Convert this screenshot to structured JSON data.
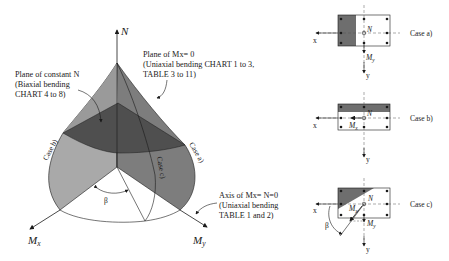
{
  "figure": {
    "surface": {
      "axes": {
        "vertical": "N",
        "left": "Mx",
        "left_sub": "x",
        "right": "My",
        "right_sub": "y"
      },
      "angle_label": "β",
      "curve_labels": [
        "Case b)",
        "Case c)",
        "Case a)"
      ],
      "annotations": {
        "constant_n": [
          "Plane of constant N",
          "(Biaxial bending",
          "CHART 4 to 8)"
        ],
        "mx_zero": [
          "Plane of Mx= 0",
          "(Uniaxial bending CHART 1 to 3,",
          "TABLE 3 to 11)"
        ],
        "axis_mx_n_zero": [
          "Axis of Mx= N=0",
          "(Uniaxial bending",
          "TABLE 1 and 2)"
        ]
      }
    },
    "sections": [
      {
        "case": "Case a)",
        "moment": "My",
        "force": "N",
        "x_label": "x",
        "y_label": "y"
      },
      {
        "case": "Case b)",
        "moment": "Mx",
        "force": "N",
        "x_label": "x",
        "y_label": "y"
      },
      {
        "case": "Case c)",
        "moments": [
          "Mx",
          "My"
        ],
        "force": "N",
        "x_label": "x",
        "y_label": "y",
        "angle": "β"
      }
    ]
  },
  "colors": {
    "light_face": "#a9a9a9",
    "mid_face": "#7d7d7d",
    "dark_band": "#4f4f4f",
    "shade": "#6e6e6e",
    "line": "#1a1a1a"
  }
}
